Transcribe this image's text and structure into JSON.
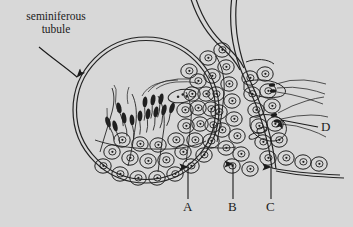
{
  "figure": {
    "kind": "biology-histology-diagram",
    "width": 353,
    "height": 227,
    "background_color": "#d8d8d8",
    "ink_color": "#1f1f1f"
  },
  "labels": {
    "seminiferous_tubule": "seminiferous\ntubule",
    "a": "A",
    "b": "B",
    "c": "C",
    "d": "D"
  },
  "callouts": [
    {
      "id": "seminiferous-tubule",
      "text": "seminiferous\ntubule",
      "text_x": 56,
      "text_y": 26,
      "arrow_from": [
        38,
        46
      ],
      "arrow_to": [
        79,
        79
      ],
      "arrow_style": "curved"
    },
    {
      "id": "a",
      "text": "A",
      "text_x": 188,
      "text_y": 209,
      "arrow_from": [
        188,
        198
      ],
      "arrow_to": [
        188,
        164
      ],
      "arrow_style": "straight-up"
    },
    {
      "id": "b",
      "text": "B",
      "text_x": 233,
      "text_y": 209,
      "arrow_from": [
        233,
        198
      ],
      "arrow_to": [
        233,
        161
      ],
      "arrow_style": "straight-up"
    },
    {
      "id": "c",
      "text": "C",
      "text_x": 271,
      "text_y": 209,
      "arrow_from": [
        271,
        198
      ],
      "arrow_to": [
        271,
        164
      ],
      "arrow_style": "straight-up"
    },
    {
      "id": "d",
      "text": "D",
      "text_x": 326,
      "text_y": 128,
      "arrow_from": [
        317,
        127
      ],
      "arrow_to": [
        277,
        119
      ],
      "arrow_style": "straight-left"
    }
  ],
  "structures": {
    "main_tubule": {
      "name": "seminiferous tubule cross-section",
      "shape": "double-walled circle",
      "center": [
        146,
        110
      ],
      "radius_outer": 72,
      "radius_inner": 68
    },
    "adjacent_tubule": {
      "name": "adjacent seminiferous tubule wall",
      "shape": "double-walled curve"
    },
    "cell_layers": [
      "spermatogonia",
      "primary spermatocytes",
      "spermatids",
      "mature spermatozoa"
    ]
  }
}
